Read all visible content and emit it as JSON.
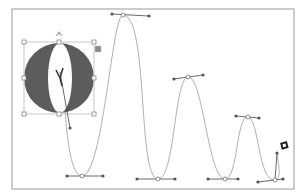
{
  "canvas": {
    "artboard": {
      "x": 12,
      "y": 9,
      "width": 282,
      "height": 180,
      "stroke": "#9a9a9a"
    },
    "colors": {
      "path": "#b0b0b0",
      "handle": "#555555",
      "handle_line": "#444444",
      "selection": "#c8c8c8",
      "shape_fill": "#5c5c5c",
      "anchor_fill": "#ffffff"
    },
    "selected_shape": {
      "type": "circle-with-ellipse-cutout",
      "circle": {
        "cx": 59,
        "cy": 78,
        "r": 35
      },
      "ellipse": {
        "cx": 60,
        "cy": 78,
        "rx": 12,
        "ry": 35
      },
      "bounding_box": {
        "x": 24,
        "y": 42,
        "width": 70,
        "height": 72
      },
      "rotate_handle_icon": "rotate-icon",
      "options_icon": "square-options-icon"
    },
    "path_anchors": [
      {
        "x": 82,
        "y": 176,
        "h1": [
          67,
          176
        ],
        "h2": [
          103,
          176
        ]
      },
      {
        "x": 123,
        "y": 15,
        "h1": [
          112,
          14
        ],
        "h2": [
          149,
          16
        ]
      },
      {
        "x": 158,
        "y": 179,
        "h1": [
          137,
          179
        ],
        "h2": [
          175,
          179
        ]
      },
      {
        "x": 188,
        "y": 77,
        "h1": [
          174,
          79
        ],
        "h2": [
          203,
          75
        ]
      },
      {
        "x": 225,
        "y": 179,
        "h1": [
          208,
          179
        ],
        "h2": [
          238,
          179
        ]
      },
      {
        "x": 248,
        "y": 117,
        "h1": [
          236,
          116
        ],
        "h2": [
          259,
          118
        ]
      },
      {
        "x": 275,
        "y": 180,
        "h1": [
          258,
          182
        ],
        "h2": [
          283,
          179
        ]
      }
    ],
    "start_handle": {
      "from": [
        60,
        72
      ],
      "to": [
        70,
        128
      ]
    },
    "end_handle": {
      "from": [
        275,
        180
      ],
      "to": [
        277,
        153
      ]
    },
    "cursor_icon": "pen-cursor-icon"
  }
}
